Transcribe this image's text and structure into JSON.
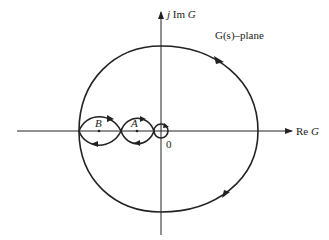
{
  "diagram": {
    "type": "nyquist-plot",
    "plane_label": "G(s)–plane",
    "axes": {
      "imag_label_prefix": "j",
      "imag_label_mid": " Im ",
      "imag_label_var": "G",
      "real_label_prefix": "Re ",
      "real_label_var": "G",
      "origin_label": "0"
    },
    "points": [
      {
        "name": "B",
        "label": "B"
      },
      {
        "name": "A",
        "label": "A"
      }
    ],
    "colors": {
      "stroke": "#222222",
      "background": "#ffffff"
    }
  }
}
